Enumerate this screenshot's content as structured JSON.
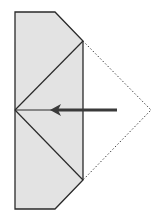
{
  "diagram": {
    "colors": {
      "paper_fill": "#e3e3e3",
      "outline": "#2a2a2a",
      "arrow": "#3a3a3a",
      "dotted": "#444444"
    },
    "elements": [
      {
        "name": "paper-shape",
        "type": "polygon"
      },
      {
        "name": "crease-upper",
        "type": "line"
      },
      {
        "name": "crease-lower",
        "type": "line"
      },
      {
        "name": "center-line",
        "type": "line"
      },
      {
        "name": "fold-flap-outline",
        "type": "dotted-polyline"
      },
      {
        "name": "fold-arrow",
        "type": "arrow",
        "direction": "left"
      }
    ]
  }
}
